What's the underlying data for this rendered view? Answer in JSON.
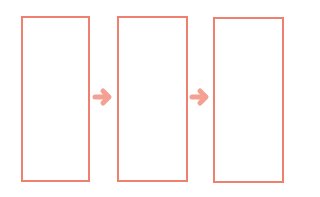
{
  "diagram": {
    "type": "flow",
    "colors": {
      "box_stroke": "#ef7f6e",
      "arrow_fill": "#f4a193",
      "background": "#ffffff"
    },
    "boxes": [
      {
        "id": "box-1",
        "label": "",
        "x": 21,
        "y": 16,
        "w": 69,
        "h": 166
      },
      {
        "id": "box-2",
        "label": "",
        "x": 117,
        "y": 16,
        "w": 71,
        "h": 166
      },
      {
        "id": "box-3",
        "label": "",
        "x": 213,
        "y": 17,
        "w": 71,
        "h": 166
      }
    ],
    "arrows": [
      {
        "id": "arrow-1",
        "from": "box-1",
        "to": "box-2",
        "icon": "right-arrow-icon"
      },
      {
        "id": "arrow-2",
        "from": "box-2",
        "to": "box-3",
        "icon": "right-arrow-icon"
      }
    ]
  }
}
